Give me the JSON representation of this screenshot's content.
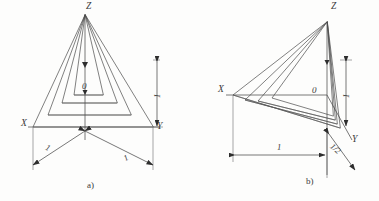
{
  "figure": {
    "background_color": "#fdfdfc",
    "line_color": "#4a4a4a",
    "text_color": "#3a3a3a"
  },
  "diagrams": [
    {
      "id": "a",
      "caption": "a)",
      "type": "isometric-axonometric",
      "axes": [
        {
          "name": "Z",
          "label": "Z",
          "direction": "up"
        },
        {
          "name": "X",
          "label": "X",
          "direction": "down-left"
        },
        {
          "name": "Y",
          "label": "Y",
          "direction": "down-right"
        }
      ],
      "origin_label": "0",
      "dimensions": [
        {
          "name": "x-unit",
          "label": "1",
          "orientation": "oblique-left"
        },
        {
          "name": "y-unit",
          "label": "1",
          "orientation": "oblique-right"
        },
        {
          "name": "z-unit",
          "label": "1",
          "orientation": "vertical"
        }
      ],
      "nested_triangle_count": 3
    },
    {
      "id": "b",
      "caption": "b)",
      "type": "dimetric-axonometric",
      "axes": [
        {
          "name": "Z",
          "label": "Z",
          "direction": "up"
        },
        {
          "name": "X",
          "label": "X",
          "direction": "left"
        },
        {
          "name": "Y",
          "label": "Y",
          "direction": "down-right"
        }
      ],
      "origin_label": "0",
      "dimensions": [
        {
          "name": "x-unit",
          "label": "1",
          "orientation": "horizontal"
        },
        {
          "name": "y-unit",
          "label": "1/2",
          "orientation": "oblique-right"
        },
        {
          "name": "z-unit",
          "label": "1",
          "orientation": "vertical"
        }
      ],
      "nested_triangle_count": 3
    }
  ]
}
